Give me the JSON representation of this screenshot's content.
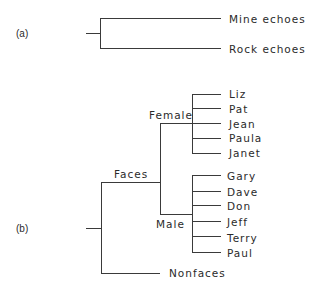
{
  "panels": {
    "a": {
      "label": "(a)",
      "leaves": [
        "Mine echoes",
        "Rock echoes"
      ]
    },
    "b": {
      "label": "(b)",
      "root_children": {
        "faces": {
          "label": "Faces",
          "female": {
            "label": "Female",
            "leaves": [
              "Liz",
              "Pat",
              "Jean",
              "Paula",
              "Janet"
            ]
          },
          "male": {
            "label": "Male",
            "leaves": [
              "Gary",
              "Dave",
              "Don",
              "Jeff",
              "Terry",
              "Paul"
            ]
          }
        },
        "nonfaces": {
          "label": "Nonfaces"
        }
      }
    }
  },
  "colors": {
    "line": "#3a3a3a",
    "text": "#2a2a2a",
    "background": "#ffffff"
  }
}
